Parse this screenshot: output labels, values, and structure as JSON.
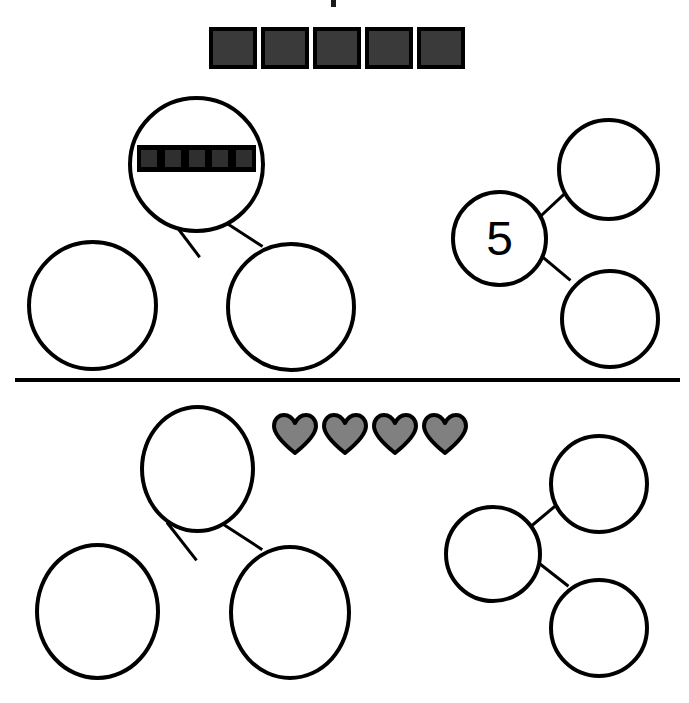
{
  "page": {
    "background_color": "#ffffff",
    "ink_color": "#000000",
    "width": 689,
    "height": 703
  },
  "colors": {
    "square_fill": "#3a3a3a",
    "square_border": "#000000",
    "heart_fill": "#808080",
    "heart_outline": "#000000",
    "mini_tile_fill": "#2f2f2f",
    "mini_bar_background": "#000000"
  },
  "top_tick": {
    "name": "cropped-mark",
    "label": ""
  },
  "exercise_1": {
    "name": "top-exercise",
    "manipulatives": {
      "type": "squares",
      "count": 5,
      "tiles": [
        "",
        "",
        "",
        "",
        ""
      ],
      "fill": "#3a3a3a"
    },
    "number_bond_blank": {
      "orientation": "vertical",
      "whole": {
        "label": "",
        "contains_picture": true,
        "picture_type": "squares-strip",
        "picture_count": 5
      },
      "parts": [
        {
          "label": ""
        },
        {
          "label": ""
        }
      ]
    },
    "number_bond_filled": {
      "orientation": "horizontal",
      "whole": {
        "label": "5"
      },
      "parts": [
        {
          "label": ""
        },
        {
          "label": ""
        }
      ]
    }
  },
  "exercise_2": {
    "name": "bottom-exercise",
    "manipulatives": {
      "type": "hearts",
      "count": 4,
      "tiles": [
        "",
        "",
        "",
        ""
      ],
      "fill": "#808080"
    },
    "number_bond_blank": {
      "orientation": "vertical",
      "whole": {
        "label": ""
      },
      "parts": [
        {
          "label": ""
        },
        {
          "label": ""
        }
      ]
    },
    "number_bond_right": {
      "orientation": "horizontal",
      "whole": {
        "label": ""
      },
      "parts": [
        {
          "label": ""
        },
        {
          "label": ""
        }
      ]
    }
  }
}
